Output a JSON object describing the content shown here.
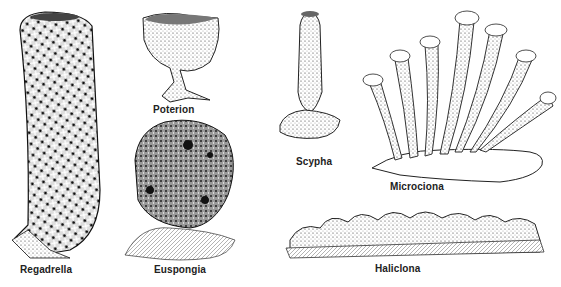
{
  "figure": {
    "specimens": [
      {
        "name": "Regadrella"
      },
      {
        "name": "Poterion"
      },
      {
        "name": "Euspongia"
      },
      {
        "name": "Scypha"
      },
      {
        "name": "Microciona"
      },
      {
        "name": "Haliclona"
      }
    ]
  },
  "colors": {
    "ink": "#1a1a1a",
    "paper": "#ffffff"
  }
}
